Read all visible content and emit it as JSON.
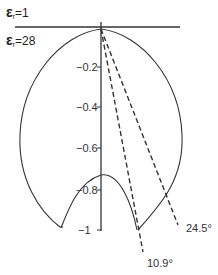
{
  "diagram": {
    "media_labels": {
      "top": {
        "symbol": "ε",
        "subscript": "r",
        "value": "=1"
      },
      "bottom": {
        "symbol": "ε",
        "subscript": "r",
        "value": "=28"
      }
    },
    "axis_ticks": [
      "−0.2",
      "−0.4",
      "−0.6",
      "−0.8",
      "−1"
    ],
    "angle_labels": [
      "24.5°",
      "10.9°"
    ],
    "colors": {
      "line": "#333333",
      "background": "#ffffff"
    }
  }
}
